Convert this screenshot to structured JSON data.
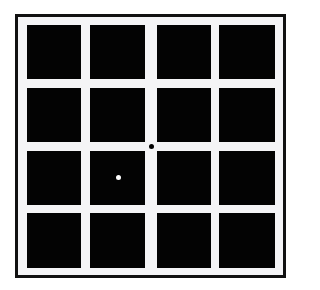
{
  "figure": {
    "grid": {
      "rows": 4,
      "cols": 4
    },
    "colors": {
      "background": "#ffffff",
      "gap": "#f4f4f6",
      "square": "#030303",
      "border": "#111111"
    },
    "column_edges": [
      [
        27,
        81
      ],
      [
        90,
        145
      ],
      [
        157,
        211
      ],
      [
        219,
        275
      ]
    ],
    "row_edges": [
      [
        25,
        79
      ],
      [
        88,
        142
      ],
      [
        151,
        205
      ],
      [
        213,
        268
      ]
    ],
    "dots": [
      {
        "name": "black-dot",
        "color": "#000000",
        "cx": 151,
        "cy": 146
      },
      {
        "name": "white-dot",
        "color": "#ffffff",
        "cx": 118,
        "cy": 177
      }
    ]
  }
}
